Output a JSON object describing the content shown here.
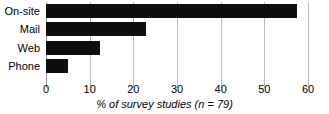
{
  "chart_data": {
    "type": "bar",
    "orientation": "horizontal",
    "title": "",
    "xlabel": "% of survey studies (n = 79)",
    "ylabel": "",
    "categories": [
      "On-site",
      "Mail",
      "Web",
      "Phone"
    ],
    "values": [
      57.5,
      22.8,
      12.4,
      5.1
    ],
    "xlim": [
      0,
      60
    ],
    "xticks": [
      0,
      10,
      20,
      30,
      40,
      50,
      60
    ],
    "xtick_labels": [
      "0",
      "10",
      "20",
      "30",
      "40",
      "50",
      "60"
    ],
    "grid": true,
    "gridlines": "vertical",
    "legend": null,
    "bar_color": "#0d0d0d",
    "grid_color": "#b9b9b9",
    "background_color": "#ffffff",
    "annotations": {
      "sample_size_note": "n = 79"
    }
  },
  "axis": {
    "title_prefix": "% of survey studies (",
    "title_n": "n",
    "title_suffix": " = 79)"
  }
}
